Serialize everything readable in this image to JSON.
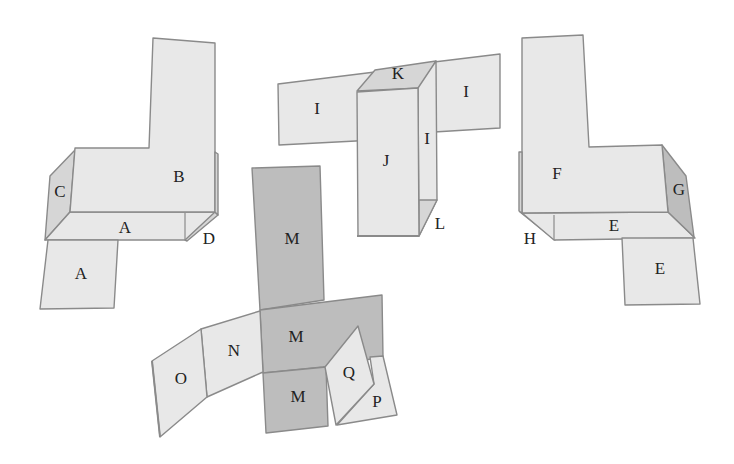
{
  "figure": {
    "colors": {
      "light_face": "#e8e8e8",
      "mid_face": "#d6d6d6",
      "dark_face": "#bdbdbd",
      "edge": "#8a8a8a",
      "label": "#222222"
    },
    "shapes": [
      {
        "id": "left-shape",
        "labels": {
          "b": "B",
          "c": "C",
          "a_top": "A",
          "a_bottom": "A",
          "d": "D"
        }
      },
      {
        "id": "middle-top-shape",
        "labels": {
          "i_left": "I",
          "i_right": "I",
          "i_side": "I",
          "j": "J",
          "k": "K",
          "l": "L"
        }
      },
      {
        "id": "right-shape",
        "labels": {
          "f": "F",
          "g": "G",
          "e_top": "E",
          "e_bottom": "E",
          "h": "H"
        }
      },
      {
        "id": "bottom-shape",
        "labels": {
          "m_top": "M",
          "m_middle": "M",
          "m_bottom": "M",
          "n": "N",
          "o": "O",
          "q": "Q",
          "p": "P"
        }
      }
    ]
  }
}
